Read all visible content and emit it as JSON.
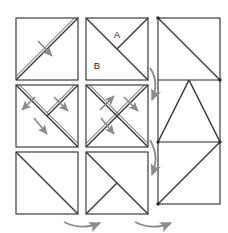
{
  "figure": {
    "title": "",
    "canvas": {
      "width": 228,
      "height": 233
    },
    "colors": {
      "background": "#ffffff",
      "outline": "#2b2b2b",
      "crease": "#3a3a3a",
      "arrow": "#8c8c8c",
      "label": "#1a1a1a"
    },
    "labels": [
      {
        "name": "region-label-a",
        "text": "A",
        "x": 117,
        "y": 37
      },
      {
        "name": "region-label-b",
        "text": "B",
        "x": 96,
        "y": 67
      }
    ],
    "grid": {
      "columns": 2,
      "rows": 3,
      "cell_size": 62,
      "squares": [
        {
          "name": "square-r1c1",
          "row": 1,
          "column": 1,
          "x": 16,
          "y": 18,
          "creases": [
            "anti-diagonal"
          ],
          "arrows": 1
        },
        {
          "name": "square-r1c2",
          "row": 1,
          "column": 2,
          "x": 86,
          "y": 18,
          "creases": [
            "main-diagonal",
            "top-right-to-center"
          ],
          "arrows": 0,
          "region_labels": [
            "A",
            "B"
          ]
        },
        {
          "name": "square-r2c1",
          "row": 2,
          "column": 1,
          "x": 16,
          "y": 85,
          "creases": [
            "main-diagonal",
            "top-right-to-center"
          ],
          "arrows": 3
        },
        {
          "name": "square-r2c2",
          "row": 2,
          "column": 2,
          "x": 86,
          "y": 85,
          "creases": [
            "main-diagonal",
            "anti-diagonal"
          ],
          "arrows": 3
        },
        {
          "name": "square-r3c1",
          "row": 3,
          "column": 1,
          "x": 16,
          "y": 152,
          "creases": [
            "main-diagonal"
          ],
          "arrows": 0
        },
        {
          "name": "square-r3c2",
          "row": 3,
          "column": 2,
          "x": 86,
          "y": 152,
          "creases": [
            "main-diagonal",
            "bottom-left-to-center"
          ],
          "arrows": 0
        }
      ]
    },
    "right_panel": {
      "name": "result-rectangle",
      "x": 158,
      "y": 18,
      "width": 62,
      "height": 186,
      "sections": 3,
      "dividers": [
        80,
        142
      ],
      "section_creases": [
        {
          "name": "section-top-crease",
          "shape": "main-diagonal"
        },
        {
          "name": "section-middle-crease",
          "shape": "inverted-v"
        },
        {
          "name": "section-bottom-crease",
          "shape": "anti-diagonal"
        }
      ]
    },
    "flow_arrows": [
      {
        "name": "flow-arrow-down-upper",
        "direction": "down",
        "style": "curved"
      },
      {
        "name": "flow-arrow-down-lower",
        "direction": "down",
        "style": "curved"
      },
      {
        "name": "flow-arrow-right-left",
        "direction": "right",
        "style": "curved"
      },
      {
        "name": "flow-arrow-right-right",
        "direction": "right",
        "style": "curved"
      }
    ]
  }
}
